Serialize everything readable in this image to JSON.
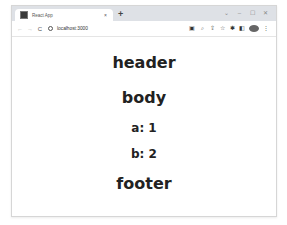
{
  "browser": {
    "tab": {
      "title": "React App",
      "close_glyph": "×",
      "favicon": "react-app-favicon"
    },
    "new_tab_glyph": "+",
    "window_controls": {
      "dropdown": "⌄",
      "minimize": "–",
      "maximize": "☐",
      "close": "✕"
    },
    "toolbar": {
      "back_glyph": "←",
      "forward_glyph": "→",
      "reload_glyph": "C",
      "url": "localhost:3000",
      "icons": [
        "translate-icon",
        "zoom-icon",
        "share-icon",
        "bookmark-star-icon",
        "extensions-icon",
        "side-panel-icon",
        "profile-avatar",
        "menu-icon"
      ],
      "glyphs": {
        "translate": "▣",
        "zoom": "⌕",
        "share": "⇪",
        "star": "☆",
        "extensions": "✱",
        "sidepanel": "◧",
        "menu": "⋮"
      }
    }
  },
  "page": {
    "header": "header",
    "body": "body",
    "items": [
      "a: 1",
      "b: 2"
    ],
    "footer": "footer"
  },
  "colors": {
    "tabstrip": "#dee1e6",
    "text": "#222222"
  }
}
